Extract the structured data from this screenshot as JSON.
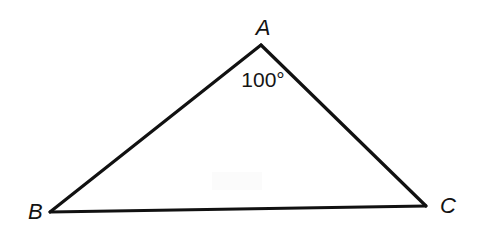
{
  "figure": {
    "type": "geometry-diagram",
    "shape": "triangle",
    "background_color": "#ffffff",
    "stroke_color": "#111111",
    "text_color": "#131313",
    "canvas": {
      "width": 477,
      "height": 235
    },
    "vertices": [
      {
        "id": "A",
        "label": "A",
        "x": 261,
        "y": 45,
        "label_x": 263,
        "label_y": 35,
        "label_anchor": "middle",
        "position": "apex-top"
      },
      {
        "id": "B",
        "label": "B",
        "x": 50,
        "y": 212,
        "label_x": 28,
        "label_y": 219,
        "label_anchor": "start",
        "position": "bottom-left"
      },
      {
        "id": "C",
        "label": "C",
        "x": 426,
        "y": 206,
        "label_x": 440,
        "label_y": 213,
        "label_anchor": "start",
        "position": "bottom-right"
      }
    ],
    "sides": [
      {
        "name": "side-AB",
        "from": "B",
        "to": "A",
        "stroke_width": 3.2,
        "path": "M 50 212 L 261 45"
      },
      {
        "name": "side-AC",
        "from": "A",
        "to": "C",
        "stroke_width": 3.2,
        "path": "M 261 45 L 426 206"
      },
      {
        "name": "side-BC",
        "from": "B",
        "to": "C",
        "stroke_width": 2.8,
        "path": "M 50 212 L 426 206"
      }
    ],
    "angles": [
      {
        "id": "angle-A",
        "at_vertex": "A",
        "value": 100,
        "unit": "degrees",
        "label": "100°",
        "label_x": 263,
        "label_y": 87,
        "label_anchor": "middle"
      }
    ],
    "artifacts": [
      {
        "name": "scan-smudge",
        "x": 212,
        "y": 172,
        "width": 50,
        "height": 18,
        "color": "#fbfbfb"
      }
    ]
  }
}
